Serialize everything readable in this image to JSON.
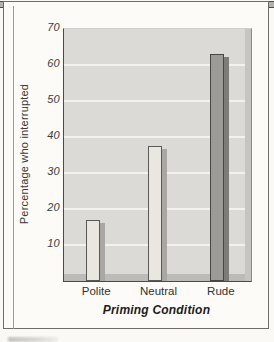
{
  "figure": {
    "y_axis_title": "Percentage who interrupted",
    "x_axis_title": "Priming Condition"
  },
  "chart_data": {
    "type": "bar",
    "title": "",
    "categories": [
      "Polite",
      "Neutral",
      "Rude"
    ],
    "values": [
      17,
      37.5,
      63
    ],
    "xlabel": "Priming Condition",
    "ylabel": "Percentage who interrupted",
    "ylim": [
      0,
      70
    ],
    "yticks": [
      10,
      20,
      30,
      40,
      50,
      60,
      70
    ],
    "grid": true,
    "legend": "none",
    "bar_styles": [
      {
        "fill": "#eae7e0",
        "shadow": "#a8a7a3",
        "outline": "#5a5955"
      },
      {
        "fill": "#eae7e0",
        "shadow": "#a8a7a3",
        "outline": "#5a5955"
      },
      {
        "fill": "#9c9b98",
        "shadow": "#7d7c79",
        "outline": "#47463f"
      }
    ],
    "colors": {
      "plot_background": "#dbdad6",
      "gridline": "#f3f2ee",
      "axis": "#4a4a4a",
      "shadow_band": "#bcbbb8",
      "frame_border": "#6e6c69"
    }
  }
}
